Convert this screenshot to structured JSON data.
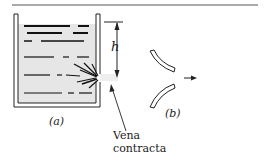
{
  "figure": {
    "part_a_label": "(a)",
    "part_b_label": "(b)",
    "dimension_label": "h",
    "annotation_line1": "Vena",
    "annotation_line2": "contracta"
  },
  "colors": {
    "water": "#e6e6e6",
    "jet": "#eeeeee",
    "line": "#222222"
  }
}
